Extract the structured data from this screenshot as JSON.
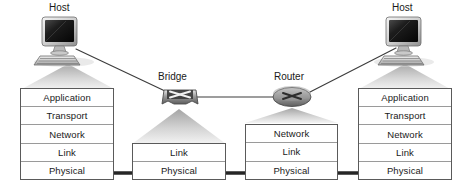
{
  "diagram": {
    "background_color": "#ffffff",
    "cable_color": "#262626",
    "link_line_color": "#3c3c3c",
    "stack_border_color": "#5a5a5a",
    "layer_divider_color": "#9a9a9a",
    "text_color": "#1a1a1a"
  },
  "nodes": [
    {
      "id": "host-left",
      "caption": "Host",
      "icon": "desktop-computer-icon",
      "layers": [
        "Application",
        "Transport",
        "Network",
        "Link",
        "Physical"
      ]
    },
    {
      "id": "bridge",
      "caption": "Bridge",
      "icon": "bridge-switch-icon",
      "layers": [
        "Link",
        "Physical"
      ]
    },
    {
      "id": "router",
      "caption": "Router",
      "icon": "router-icon",
      "layers": [
        "Network",
        "Link",
        "Physical"
      ]
    },
    {
      "id": "host-right",
      "caption": "Host",
      "icon": "desktop-computer-icon",
      "layers": [
        "Application",
        "Transport",
        "Network",
        "Link",
        "Physical"
      ]
    }
  ],
  "links": [
    {
      "from": "host-left",
      "to": "bridge"
    },
    {
      "from": "bridge",
      "to": "router"
    },
    {
      "from": "router",
      "to": "host-right"
    }
  ],
  "cables": [
    {
      "from": "host-left",
      "to": "bridge",
      "from_layer": "Application",
      "to_layer": "Link"
    },
    {
      "from": "bridge",
      "to": "router",
      "from_layer": "Link",
      "to_layer": "Network"
    },
    {
      "from": "router",
      "to": "host-right",
      "from_layer": "Network",
      "to_layer": "Application"
    }
  ]
}
